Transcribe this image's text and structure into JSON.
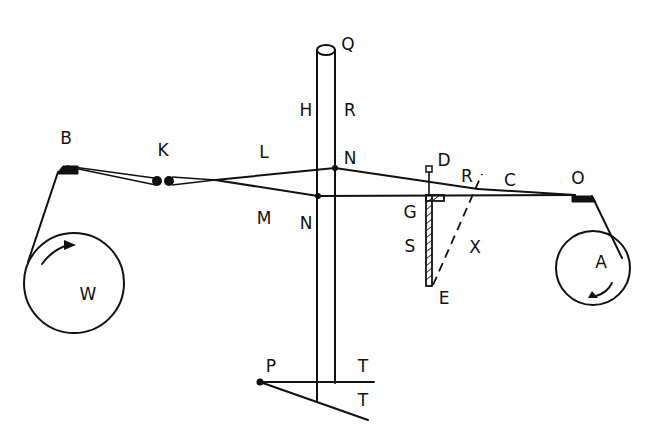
{
  "diagram": {
    "type": "mechanical schematic (line drawing)",
    "labels": {
      "Q": "Q",
      "H": "H",
      "R_rod": "R",
      "B": "B",
      "K": "K",
      "L": "L",
      "N_upper": "N",
      "D": "D",
      "R_right": "R",
      "C": "C",
      "O": "O",
      "M": "M",
      "N_lower": "N",
      "G": "G",
      "S": "S",
      "X": "X",
      "E": "E",
      "W": "W",
      "A": "A",
      "P": "P",
      "T_upper": "T",
      "T_lower": "T"
    },
    "components": [
      {
        "id": "vertical-rod",
        "labels": [
          "Q",
          "H",
          "R"
        ]
      },
      {
        "id": "left-drum",
        "label": "W",
        "arrow": "clockwise"
      },
      {
        "id": "right-drum",
        "label": "A",
        "arrow": "clockwise"
      },
      {
        "id": "left-pulley-block",
        "label": "B"
      },
      {
        "id": "right-pulley-block",
        "label": "O"
      },
      {
        "id": "double-pulley",
        "label": "K"
      },
      {
        "id": "hatched-scale",
        "labels": [
          "G",
          "S",
          "E",
          "D"
        ]
      },
      {
        "id": "dashed-line",
        "from": "E",
        "to": "R",
        "label": "X"
      },
      {
        "id": "base-pointer",
        "labels": [
          "P",
          "T",
          "T"
        ]
      }
    ],
    "colors": {
      "ink": "#111111",
      "paper": "#ffffff"
    }
  }
}
